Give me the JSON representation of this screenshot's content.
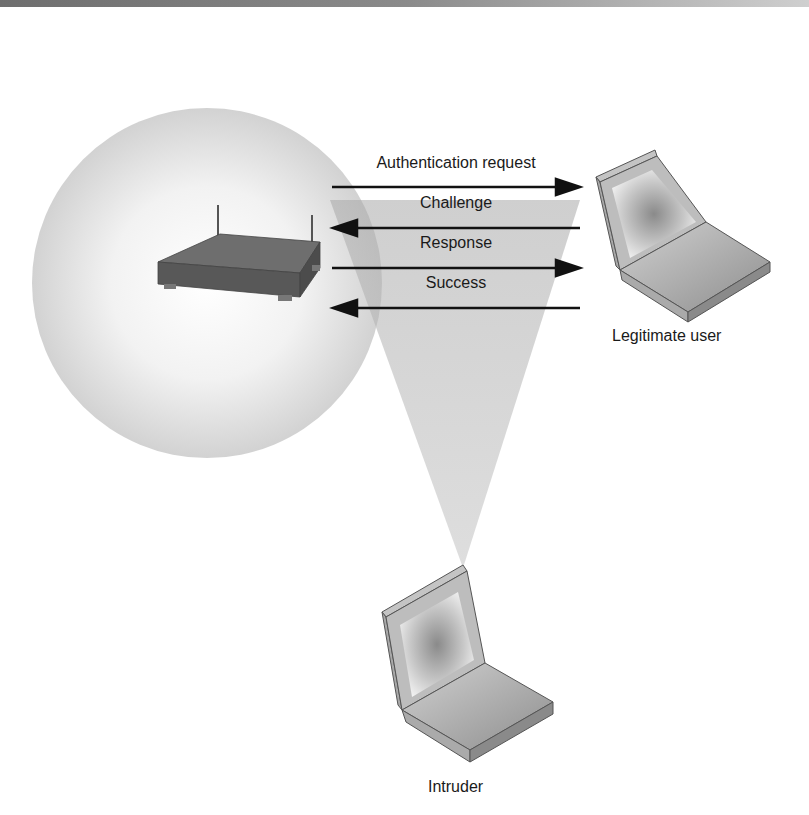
{
  "diagram": {
    "type": "wireless-authentication-eavesdropping",
    "nodes": {
      "access_point": {
        "label": ""
      },
      "legitimate_user": {
        "label": "Legitimate user"
      },
      "intruder": {
        "label": "Intruder"
      }
    },
    "messages": [
      {
        "label": "Authentication request",
        "direction": "to-user"
      },
      {
        "label": "Challenge",
        "direction": "to-access-point"
      },
      {
        "label": "Response",
        "direction": "to-user"
      },
      {
        "label": "Success",
        "direction": "to-access-point"
      }
    ],
    "colors": {
      "coverage": "#d6d6d6",
      "cone": "#bdbdbd",
      "arrow": "#111111",
      "laptop_body": "#b8b8b8",
      "router": "#5a5a5a"
    }
  }
}
